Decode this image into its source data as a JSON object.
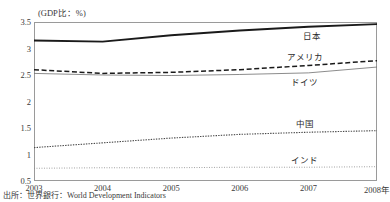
{
  "axis_note": "(GDP比：%)",
  "source_note": "出所：世界銀行：World Development Indicators",
  "labels": {
    "japan": "日本",
    "usa": "アメリカ",
    "germany": "ドイツ",
    "china": "中国",
    "india": "インド"
  },
  "chart_data": {
    "type": "line",
    "title": "",
    "subtitle": "",
    "xlabel": "2008年",
    "ylabel": "(GDP比：%)",
    "x": [
      2003,
      2004,
      2005,
      2006,
      2007,
      2008
    ],
    "xtick_labels": [
      "2003",
      "2004",
      "2005",
      "2006",
      "2007",
      "2008年"
    ],
    "ytick_labels": [
      "0.5",
      "1",
      "1.5",
      "2",
      "2.5",
      "3",
      "3.5"
    ],
    "ytick_values": [
      0.5,
      1.0,
      1.5,
      2.0,
      2.5,
      3.0,
      3.5
    ],
    "ylim": [
      0.5,
      3.5
    ],
    "xlim": [
      2003,
      2008
    ],
    "grid": false,
    "legend": "inline-right",
    "series": [
      {
        "name": "日本",
        "style": "solid-thick",
        "color": "#1a1a1a",
        "values": [
          3.15,
          3.13,
          3.25,
          3.34,
          3.41,
          3.46
        ]
      },
      {
        "name": "アメリカ",
        "style": "dashed",
        "color": "#1a1a1a",
        "values": [
          2.6,
          2.53,
          2.55,
          2.6,
          2.68,
          2.77
        ]
      },
      {
        "name": "ドイツ",
        "style": "solid-thin",
        "color": "#6f6f6f",
        "values": [
          2.53,
          2.5,
          2.49,
          2.51,
          2.54,
          2.65
        ]
      },
      {
        "name": "中国",
        "style": "dotted",
        "color": "#4a4a4a",
        "values": [
          1.13,
          1.22,
          1.31,
          1.38,
          1.42,
          1.45
        ]
      },
      {
        "name": "インド",
        "style": "fine-dotted",
        "color": "#8c8c8c",
        "values": [
          0.74,
          0.75,
          0.75,
          0.76,
          0.76,
          0.77
        ]
      }
    ],
    "series_labels": [
      {
        "name": "日本",
        "x": 2007.05,
        "y": 3.26
      },
      {
        "name": "アメリカ",
        "x": 2006.95,
        "y": 2.86
      },
      {
        "name": "ドイツ",
        "x": 2006.95,
        "y": 2.38
      },
      {
        "name": "中国",
        "x": 2006.95,
        "y": 1.6
      },
      {
        "name": "インド",
        "x": 2006.95,
        "y": 0.92
      }
    ]
  }
}
